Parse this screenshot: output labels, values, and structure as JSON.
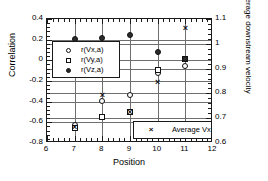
{
  "chart_data": {
    "type": "scatter",
    "title": "",
    "xlabel": "Position",
    "ylabel": "Correlation",
    "y2label": "Average downstream velocity",
    "xlim": [
      6,
      12
    ],
    "ylim": [
      -0.8,
      0.4
    ],
    "y2lim": [
      0.6,
      1.1
    ],
    "xticks": [
      "6",
      "7",
      "8",
      "9",
      "10",
      "11",
      "12"
    ],
    "yticks": [
      "0.4",
      "0.2",
      "0",
      "-0.2",
      "-0.4",
      "-0.6",
      "-0.8"
    ],
    "y2ticks": [
      "1.1",
      "1",
      "0.9",
      "0.8",
      "0.7",
      "0.6"
    ],
    "grid": true,
    "legend_position": "inside",
    "x": [
      7,
      8,
      9,
      10,
      11
    ],
    "series": [
      {
        "name": "r(Vx,a)",
        "marker": "circle",
        "axis": "left",
        "values": [
          -0.63,
          -0.39,
          -0.34,
          -0.12,
          -0.05
        ]
      },
      {
        "name": "r(Vy,a)",
        "marker": "square",
        "axis": "left",
        "values": [
          -0.65,
          -0.55,
          -0.5,
          -0.09,
          0.01
        ]
      },
      {
        "name": "r(Vz,a)",
        "marker": "diamond",
        "axis": "left",
        "values": [
          0.21,
          0.22,
          0.25,
          0.08,
          0.01
        ]
      },
      {
        "name": "Average Vx",
        "marker": "cross",
        "axis": "right",
        "values": [
          0.665,
          0.795,
          0.725,
          0.845,
          1.065
        ]
      }
    ]
  },
  "axes": {
    "x_title": "Position",
    "y_left_title": "Correlation",
    "y_right_title": "Average downstream velocity"
  },
  "legend_correlation": {
    "items": [
      {
        "label": "r(Vx,a)",
        "marker": "circle-marker"
      },
      {
        "label": "r(Vy,a)",
        "marker": "square-marker"
      },
      {
        "label": "r(Vz,a)",
        "marker": "diamond-marker"
      }
    ]
  },
  "legend_velocity": {
    "items": [
      {
        "label": "Average Vx",
        "marker": "cross-marker",
        "glyph": "×"
      }
    ]
  },
  "marker_glyphs": {
    "cross": "×"
  }
}
